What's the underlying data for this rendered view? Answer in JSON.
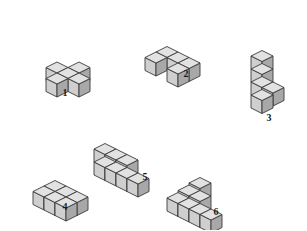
{
  "page": {
    "background_color": "#ffffff",
    "width": 307,
    "height": 230
  },
  "palette": {
    "top_face": "#e2e2e2",
    "left_face": "#cfcfcf",
    "right_face": "#a8a8a8",
    "outline": "#3a3a3a",
    "label_color": "#1a1a1a"
  },
  "geometry": {
    "cube_half_width": 11,
    "cube_height": 13,
    "note": "Isometric projection: x-axis goes right-and-down, y-axis goes right-and-up, z-axis is vertical."
  },
  "figures": [
    {
      "id": "figure-1",
      "label": "1",
      "name": "plus-cross-block",
      "cube_count": 5,
      "cubes": [
        [
          1,
          1,
          0
        ],
        [
          0,
          1,
          0
        ],
        [
          2,
          1,
          0
        ],
        [
          1,
          0,
          0
        ],
        [
          1,
          2,
          0
        ]
      ],
      "origin": {
        "x": 68,
        "y": 62
      },
      "label_pos": {
        "x": 55,
        "y": 88
      }
    },
    {
      "id": "figure-2",
      "label": "2",
      "name": "flat-u-notch-block",
      "cube_count": 5,
      "cubes": [
        [
          0,
          0,
          0
        ],
        [
          1,
          0,
          0
        ],
        [
          2,
          0,
          0
        ],
        [
          0,
          1,
          0
        ],
        [
          2,
          1,
          0
        ]
      ],
      "origin": {
        "x": 167,
        "y": 52
      },
      "label_pos": {
        "x": 176,
        "y": 69
      }
    },
    {
      "id": "figure-3",
      "label": "3",
      "name": "vertical-tower-with-spur",
      "cube_count": 5,
      "cubes": [
        [
          0,
          0,
          0
        ],
        [
          0,
          0,
          1
        ],
        [
          0,
          0,
          2
        ],
        [
          0,
          0,
          3
        ],
        [
          1,
          0,
          1
        ]
      ],
      "origin": {
        "x": 262,
        "y": 95
      },
      "label_pos": {
        "x": 259,
        "y": 113
      }
    },
    {
      "id": "figure-4",
      "label": "4",
      "name": "flat-slab-3x2",
      "cube_count": 6,
      "cubes": [
        [
          0,
          0,
          0
        ],
        [
          1,
          0,
          0
        ],
        [
          2,
          0,
          0
        ],
        [
          0,
          1,
          0
        ],
        [
          1,
          1,
          0
        ],
        [
          2,
          1,
          0
        ]
      ],
      "origin": {
        "x": 55,
        "y": 186
      },
      "label_pos": {
        "x": 55,
        "y": 202
      }
    },
    {
      "id": "figure-5",
      "label": "5",
      "name": "two-step-stair-block",
      "cube_count": 7,
      "cubes": [
        [
          0,
          0,
          0
        ],
        [
          1,
          0,
          0
        ],
        [
          2,
          0,
          0
        ],
        [
          3,
          0,
          0
        ],
        [
          0,
          0,
          1
        ],
        [
          1,
          0,
          1
        ],
        [
          2,
          0,
          1
        ]
      ],
      "origin": {
        "x": 105,
        "y": 162
      },
      "label_pos": {
        "x": 135,
        "y": 172
      }
    },
    {
      "id": "figure-6",
      "label": "6",
      "name": "pyramid-stair-block",
      "cube_count": 7,
      "cubes": [
        [
          0,
          0,
          0
        ],
        [
          1,
          0,
          0
        ],
        [
          2,
          0,
          0
        ],
        [
          3,
          0,
          0
        ],
        [
          1,
          0,
          1
        ],
        [
          2,
          0,
          1
        ],
        [
          2,
          0,
          2
        ]
      ],
      "origin": {
        "x": 178,
        "y": 198
      },
      "label_pos": {
        "x": 206,
        "y": 207
      }
    }
  ]
}
